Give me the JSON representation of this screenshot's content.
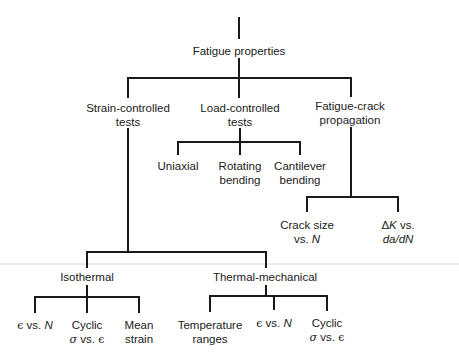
{
  "diagram": {
    "type": "tree",
    "root": {
      "label": "Fatigue properties",
      "children": [
        {
          "label": [
            "Strain-controlled",
            "tests"
          ],
          "children": [
            {
              "label": "Isothermal",
              "children": [
                {
                  "label": "ϵ vs. N"
                },
                {
                  "label": [
                    "Cyclic",
                    "σ vs. ϵ"
                  ]
                },
                {
                  "label": [
                    "Mean",
                    "strain"
                  ]
                }
              ]
            },
            {
              "label": "Thermal-mechanical",
              "children": [
                {
                  "label": [
                    "Temperature",
                    "ranges"
                  ]
                },
                {
                  "label": "ϵ vs. N"
                },
                {
                  "label": [
                    "Cyclic",
                    "σ vs. ϵ"
                  ]
                }
              ]
            }
          ]
        },
        {
          "label": [
            "Load-controlled",
            "tests"
          ],
          "children": [
            {
              "label": "Uniaxial"
            },
            {
              "label": [
                "Rotating",
                "bending"
              ]
            },
            {
              "label": [
                "Cantilever",
                "bending"
              ]
            }
          ]
        },
        {
          "label": [
            "Fatigue-crack",
            "propagation"
          ],
          "children": [
            {
              "label": [
                "Crack size",
                "vs. N"
              ]
            },
            {
              "label": [
                "ΔK vs.",
                "da/dN"
              ]
            }
          ]
        }
      ]
    }
  },
  "labels": {
    "root": "Fatigue properties",
    "strain": {
      "l1": "Strain-controlled",
      "l2": "tests"
    },
    "load": {
      "l1": "Load-controlled",
      "l2": "tests"
    },
    "crack": {
      "l1": "Fatigue-crack",
      "l2": "propagation"
    },
    "uniaxial": "Uniaxial",
    "rotating": {
      "l1": "Rotating",
      "l2": "bending"
    },
    "cantilever": {
      "l1": "Cantilever",
      "l2": "bending"
    },
    "crack_size": {
      "l1": "Crack size",
      "vs": "vs. ",
      "n": "N"
    },
    "delta_k": {
      "delta": "Δ",
      "k": "K",
      "vs": " vs.",
      "l2": "da/dN"
    },
    "isothermal": "Isothermal",
    "thermal_mechanical": "Thermal-mechanical",
    "iso_eps": {
      "eps": "ϵ",
      "vs": " vs. ",
      "n": "N"
    },
    "iso_cyclic": {
      "l1": "Cyclic",
      "sigma": "σ",
      "vs": " vs. ",
      "eps": "ϵ"
    },
    "iso_mean": {
      "l1": "Mean",
      "l2": "strain"
    },
    "tm_temp": {
      "l1": "Temperature",
      "l2": "ranges"
    },
    "tm_eps": {
      "eps": "ϵ",
      "vs": " vs. ",
      "n": "N"
    },
    "tm_cyclic": {
      "l1": "Cyclic",
      "sigma": "σ",
      "vs": " vs. ",
      "eps": "ϵ"
    }
  }
}
